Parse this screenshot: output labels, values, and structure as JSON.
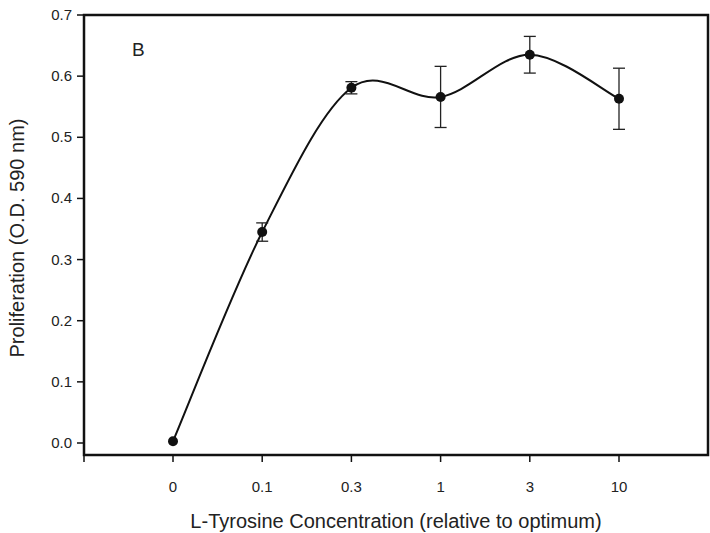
{
  "chart_data": {
    "type": "line",
    "title": "",
    "panel_label": "B",
    "xlabel": "L-Tyrosine Concentration (relative to optimum)",
    "ylabel": "Proliferation (O.D. 590 nm)",
    "x_scale": "categorical",
    "categories": [
      "0",
      "0.1",
      "0.3",
      "1",
      "3",
      "10"
    ],
    "series": [
      {
        "name": "Proliferation",
        "values": [
          0.003,
          0.345,
          0.581,
          0.566,
          0.635,
          0.563
        ],
        "errors": [
          0.0,
          0.015,
          0.01,
          0.05,
          0.03,
          0.05
        ],
        "marker": "filled-circle",
        "line": "smooth",
        "color": "#111111"
      }
    ],
    "ylim": [
      0.0,
      0.7
    ],
    "yticks": [
      "0.0",
      "0.1",
      "0.2",
      "0.3",
      "0.4",
      "0.5",
      "0.6",
      "0.7"
    ],
    "grid": false,
    "legend": null
  }
}
